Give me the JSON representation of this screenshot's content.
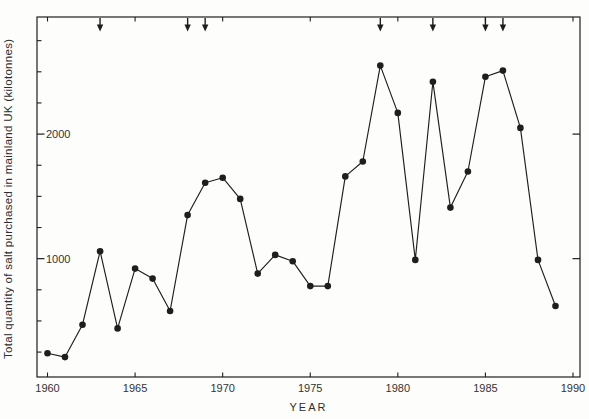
{
  "figure": {
    "background": "#fdfdfb",
    "ink_color": "#1e1e1e",
    "label_color": "#333333"
  },
  "chart_data": {
    "type": "line",
    "title": "",
    "xlabel": "YEAR",
    "ylabel": "Total quantity of salt purchased in mainland UK (kilotonnes)",
    "x": [
      1960,
      1961,
      1962,
      1963,
      1964,
      1965,
      1966,
      1967,
      1968,
      1969,
      1970,
      1971,
      1972,
      1973,
      1974,
      1975,
      1976,
      1977,
      1978,
      1979,
      1980,
      1981,
      1982,
      1983,
      1984,
      1985,
      1986,
      1987,
      1988,
      1989
    ],
    "values": [
      240,
      210,
      470,
      1060,
      440,
      920,
      840,
      580,
      1350,
      1610,
      1650,
      1480,
      880,
      1030,
      980,
      780,
      780,
      1660,
      1780,
      2550,
      2170,
      990,
      2420,
      1410,
      1700,
      2460,
      2510,
      2050,
      990,
      620
    ],
    "xlim": [
      1959.4,
      1990.4
    ],
    "ylim": [
      50,
      2940
    ],
    "x_ticks": [
      1960,
      1965,
      1970,
      1975,
      1980,
      1985,
      1990
    ],
    "x_tick_labels": [
      "1960",
      "1965",
      "1970",
      "1975",
      "1980",
      "1985",
      "1990"
    ],
    "y_major_ticks": [
      1000,
      2000
    ],
    "y_major_tick_labels": [
      "1000",
      "2000"
    ],
    "y_minor_ticks": [
      250,
      500,
      750,
      1250,
      1500,
      1750,
      2250,
      2500,
      2750
    ],
    "marker": "filled-circle",
    "grid": false,
    "legend": null,
    "arrow_marker_years": [
      1963,
      1968,
      1969,
      1979,
      1982,
      1985,
      1986
    ]
  }
}
